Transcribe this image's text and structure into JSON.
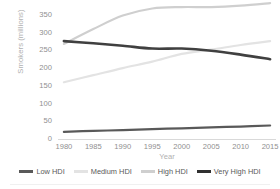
{
  "chart_data": {
    "type": "line",
    "title": "",
    "xlabel": "Year",
    "ylabel": "Smokers (millions)",
    "x": [
      1980,
      1985,
      1990,
      1995,
      2000,
      2005,
      2010,
      2015
    ],
    "xlim": [
      1979,
      2016
    ],
    "ylim": [
      0,
      375
    ],
    "yticks": [
      0,
      50,
      100,
      150,
      200,
      250,
      300,
      350
    ],
    "xticks": [
      1980,
      1985,
      1990,
      1995,
      2000,
      2005,
      2010,
      2015
    ],
    "grid": false,
    "legend_position": "bottom",
    "series": [
      {
        "name": "Low HDI",
        "color": "#595959",
        "width": 2.2,
        "values": [
          20,
          23,
          25,
          28,
          30,
          33,
          35,
          38
        ]
      },
      {
        "name": "Medium HDI",
        "color": "#e3e3e3",
        "width": 2.2,
        "values": [
          160,
          180,
          200,
          218,
          240,
          252,
          265,
          276
        ]
      },
      {
        "name": "High HDI",
        "color": "#cfcfcf",
        "width": 2.2,
        "values": [
          268,
          310,
          348,
          368,
          372,
          372,
          376,
          383
        ]
      },
      {
        "name": "Very High HDI",
        "color": "#404040",
        "width": 2.6,
        "values": [
          276,
          270,
          263,
          255,
          255,
          249,
          238,
          225
        ]
      }
    ]
  },
  "axes": {
    "y_tick_labels": [
      "350",
      "300",
      "250",
      "200",
      "150",
      "100",
      "50",
      "0"
    ],
    "x_tick_labels": [
      "1980",
      "1985",
      "1990",
      "1995",
      "2000",
      "2005",
      "2010",
      "2015"
    ],
    "y_title": "Smokers (millions)",
    "x_title": "Year"
  },
  "legend": {
    "items": [
      {
        "label": "Low HDI",
        "color": "#595959",
        "width": 2.6
      },
      {
        "label": "Medium HDI",
        "color": "#e3e3e3",
        "width": 2.2
      },
      {
        "label": "High HDI",
        "color": "#cfcfcf",
        "width": 2.2
      },
      {
        "label": "Very High HDI",
        "color": "#303030",
        "width": 2.8
      }
    ]
  }
}
